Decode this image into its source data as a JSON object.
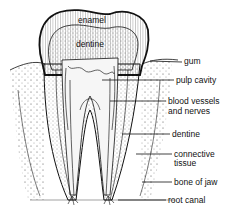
{
  "diagram": {
    "inner_labels": {
      "enamel": "enamel",
      "dentine_crown": "dentine"
    },
    "callouts": [
      {
        "label": "gum"
      },
      {
        "label": "pulp cavity"
      },
      {
        "label": "blood vessels\nand nerves",
        "line1": "blood vessels",
        "line2": "and nerves"
      },
      {
        "label": "dentine"
      },
      {
        "label": "connective\ntissue",
        "line1": "connective",
        "line2": "tissue"
      },
      {
        "label": "bone of jaw"
      },
      {
        "label": "root canal"
      }
    ]
  }
}
